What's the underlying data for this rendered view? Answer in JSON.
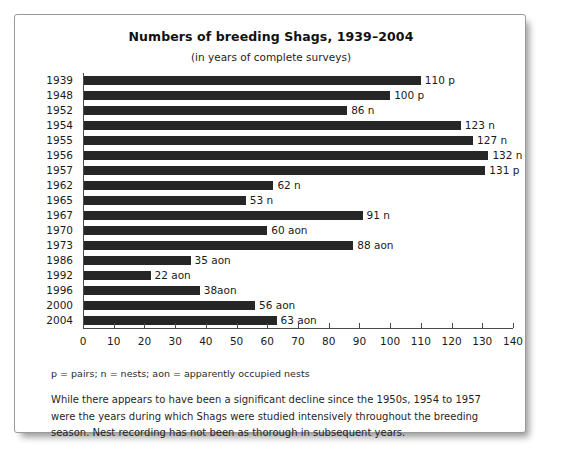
{
  "chart_data": {
    "type": "bar",
    "orientation": "horizontal",
    "title": "Numbers of breeding Shags, 1939–2004",
    "subtitle": "(in years of complete surveys)",
    "xlabel": "",
    "ylabel": "",
    "xlim": [
      0,
      140
    ],
    "xticks": [
      0,
      10,
      20,
      30,
      40,
      50,
      60,
      70,
      80,
      90,
      100,
      110,
      120,
      130,
      140
    ],
    "grid": false,
    "legend": null,
    "bar_color": "#262626",
    "categories": [
      "1939",
      "1948",
      "1952",
      "1954",
      "1955",
      "1956",
      "1957",
      "1962",
      "1965",
      "1967",
      "1970",
      "1973",
      "1986",
      "1992",
      "1996",
      "2000",
      "2004"
    ],
    "values": [
      110,
      100,
      86,
      123,
      127,
      132,
      131,
      62,
      53,
      91,
      60,
      88,
      35,
      22,
      38,
      56,
      63
    ],
    "data_labels": [
      "110 p",
      "100 p",
      "86 n",
      "123 n",
      "127 n",
      "132 n",
      "131 p",
      "62 n",
      "53 n",
      "91 n",
      "60 aon",
      "88 aon",
      "35 aon",
      "22 aon",
      "38aon",
      "56 aon",
      "63 aon"
    ],
    "units": [
      "p",
      "p",
      "n",
      "n",
      "n",
      "n",
      "p",
      "n",
      "n",
      "n",
      "aon",
      "aon",
      "aon",
      "aon",
      "aon",
      "aon",
      "aon"
    ],
    "bars": [
      {
        "year": "1939",
        "value": 110,
        "label": "110 p",
        "unit": "p"
      },
      {
        "year": "1948",
        "value": 100,
        "label": "100 p",
        "unit": "p"
      },
      {
        "year": "1952",
        "value": 86,
        "label": "86 n",
        "unit": "n"
      },
      {
        "year": "1954",
        "value": 123,
        "label": "123 n",
        "unit": "n"
      },
      {
        "year": "1955",
        "value": 127,
        "label": "127 n",
        "unit": "n"
      },
      {
        "year": "1956",
        "value": 132,
        "label": "132 n",
        "unit": "n"
      },
      {
        "year": "1957",
        "value": 131,
        "label": "131 p",
        "unit": "p"
      },
      {
        "year": "1962",
        "value": 62,
        "label": "62 n",
        "unit": "n"
      },
      {
        "year": "1965",
        "value": 53,
        "label": "53 n",
        "unit": "n"
      },
      {
        "year": "1967",
        "value": 91,
        "label": "91 n",
        "unit": "n"
      },
      {
        "year": "1970",
        "value": 60,
        "label": "60 aon",
        "unit": "aon"
      },
      {
        "year": "1973",
        "value": 88,
        "label": "88 aon",
        "unit": "aon"
      },
      {
        "year": "1986",
        "value": 35,
        "label": "35 aon",
        "unit": "aon"
      },
      {
        "year": "1992",
        "value": 22,
        "label": "22 aon",
        "unit": "aon"
      },
      {
        "year": "1996",
        "value": 38,
        "label": "38aon",
        "unit": "aon"
      },
      {
        "year": "2000",
        "value": 56,
        "label": "56 aon",
        "unit": "aon"
      },
      {
        "year": "2004",
        "value": 63,
        "label": "63 aon",
        "unit": "aon"
      }
    ],
    "footnote": "p = pairs; n = nests; aon = apparently occupied nests",
    "caption": "While there appears to have been a significant decline since the 1950s, 1954 to 1957 were the years during which Shags were studied intensively throughout the breeding season. Nest recording has not been as thorough in subsequent years."
  }
}
